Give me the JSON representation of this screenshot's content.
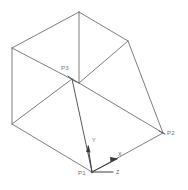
{
  "drawing": {
    "title": "3D wireframe box with coordinate triad",
    "background_color": "#ffffff",
    "edge_color": "#6e6e6e",
    "label_color": "#757575",
    "axis_color": "#3c3c3c"
  },
  "points": [
    {
      "id": "p1",
      "label": "P1",
      "x": 92,
      "y": 172,
      "label_x": 78,
      "label_y": 172
    },
    {
      "id": "p2",
      "label": "P2",
      "x": 163,
      "y": 133,
      "label_x": 167,
      "label_y": 133
    },
    {
      "id": "p3",
      "label": "P3",
      "x": 72,
      "y": 79,
      "label_x": 61,
      "label_y": 68
    }
  ],
  "axes": [
    {
      "id": "x",
      "label": "X",
      "label_x": 118,
      "label_y": 156,
      "from_x": 92,
      "from_y": 172,
      "to_x": 117,
      "to_y": 159
    },
    {
      "id": "y",
      "label": "Y",
      "label_x": 93,
      "label_y": 141,
      "from_x": 92,
      "from_y": 172,
      "to_x": 88,
      "to_y": 146
    },
    {
      "id": "z",
      "label": "Z",
      "label_x": 117,
      "label_y": 173,
      "from_x": 92,
      "from_y": 172,
      "to_x": 113,
      "to_y": 172
    }
  ],
  "vertices": {
    "top_apex": {
      "x": 79,
      "y": 12
    },
    "left_top": {
      "x": 12,
      "y": 48
    },
    "left_bottom": {
      "x": 12,
      "y": 124
    },
    "right_top": {
      "x": 128,
      "y": 41
    },
    "center_top": {
      "x": 79,
      "y": 83
    },
    "p3": {
      "x": 72,
      "y": 79
    },
    "p2": {
      "x": 163,
      "y": 133
    },
    "p1": {
      "x": 92,
      "y": 172
    },
    "mid_left": {
      "x": 60,
      "y": 73
    }
  },
  "edges": [
    {
      "name": "apex-to-left-top",
      "path": "M79,12 L12,48"
    },
    {
      "name": "apex-to-right-top",
      "path": "M79,12 L128,41"
    },
    {
      "name": "apex-vertical",
      "path": "M79,12 L79,83"
    },
    {
      "name": "left-top-to-center",
      "path": "M12,48 L79,83"
    },
    {
      "name": "right-top-to-center",
      "path": "M128,41 L79,83"
    },
    {
      "name": "left-vertical",
      "path": "M12,48 L12,124"
    },
    {
      "name": "left-bottom-to-p1",
      "path": "M12,124 L92,172"
    },
    {
      "name": "left-bottom-to-p3",
      "path": "M12,124 L72,79"
    },
    {
      "name": "p3-to-center",
      "path": "M72,79 L79,83"
    },
    {
      "name": "p3-to-p1",
      "path": "M72,79 L92,172"
    },
    {
      "name": "center-to-p2",
      "path": "M79,83 L163,133"
    },
    {
      "name": "right-top-to-p2",
      "path": "M128,41 L163,133"
    },
    {
      "name": "p2-to-p1",
      "path": "M163,133 L92,172"
    }
  ]
}
